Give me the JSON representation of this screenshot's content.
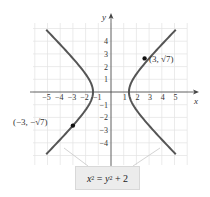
{
  "graph": {
    "axes": {
      "x_label": "x",
      "y_label": "y"
    },
    "x_ticks": [
      "−5",
      "−4",
      "−3",
      "−2",
      "−1",
      "1",
      "2",
      "3",
      "4",
      "5"
    ],
    "x_tick_values": [
      -5,
      -4,
      -3,
      -2,
      -1,
      1,
      2,
      3,
      4,
      5
    ],
    "y_ticks": [
      "4",
      "3",
      "2",
      "1",
      "−1",
      "−2",
      "−3",
      "−4"
    ],
    "y_tick_values": [
      4,
      3,
      2,
      1,
      -1,
      -2,
      -3,
      -4
    ],
    "points": [
      {
        "label": "(3, √7)",
        "x": 3,
        "y": 2.6458
      },
      {
        "label": "(−3, −√7)",
        "x": -3,
        "y": -2.6458
      }
    ],
    "equation": {
      "lhs": "x",
      "lhs_exp": "2",
      "eq": " = ",
      "rhs_var": "y",
      "rhs_exp": "2",
      "rhs_rest": " + 2",
      "full": "x² = y² + 2"
    },
    "colors": {
      "curve": "#555555",
      "grid": "#e2e2e2",
      "axis": "#444444",
      "leader": "#c8c8c8",
      "box": "#ececec"
    }
  }
}
